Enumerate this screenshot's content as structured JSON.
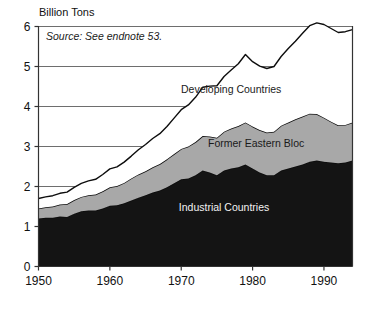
{
  "chart_data": {
    "type": "area",
    "stacked": true,
    "title": "",
    "ylabel": "Billion Tons",
    "xlabel": "",
    "xlim": [
      1950,
      1994
    ],
    "ylim": [
      0,
      6
    ],
    "yticks": [
      0,
      1,
      2,
      3,
      4,
      5,
      6
    ],
    "ytick_labels": [
      "0",
      "1",
      "2",
      "3",
      "4",
      "5",
      "6"
    ],
    "xticks": [
      1950,
      1960,
      1970,
      1980,
      1990
    ],
    "xtick_labels": [
      "1950",
      "1960",
      "1970",
      "1980",
      "1990"
    ],
    "grid": "horizontal-gridlines-at-2-3-4-5-6",
    "legend_position": "inline-annotations",
    "source_note": "Source: See endnote 53.",
    "x": [
      1950,
      1951,
      1952,
      1953,
      1954,
      1955,
      1956,
      1957,
      1958,
      1959,
      1960,
      1961,
      1962,
      1963,
      1964,
      1965,
      1966,
      1967,
      1968,
      1969,
      1970,
      1971,
      1972,
      1973,
      1974,
      1975,
      1976,
      1977,
      1978,
      1979,
      1980,
      1981,
      1982,
      1983,
      1984,
      1985,
      1986,
      1987,
      1988,
      1989,
      1990,
      1991,
      1992,
      1993,
      1994
    ],
    "series": [
      {
        "name": "Industrial Countries",
        "color": "#141414",
        "label_color": "#f2f2f2",
        "values": [
          1.2,
          1.22,
          1.22,
          1.25,
          1.24,
          1.32,
          1.38,
          1.4,
          1.4,
          1.45,
          1.52,
          1.53,
          1.58,
          1.65,
          1.72,
          1.78,
          1.85,
          1.9,
          1.98,
          2.08,
          2.18,
          2.2,
          2.28,
          2.4,
          2.35,
          2.28,
          2.4,
          2.45,
          2.48,
          2.55,
          2.45,
          2.35,
          2.28,
          2.28,
          2.4,
          2.45,
          2.5,
          2.55,
          2.62,
          2.65,
          2.62,
          2.6,
          2.58,
          2.6,
          2.65
        ]
      },
      {
        "name": "Former Eastern Bloc",
        "color": "#a8a8a8",
        "label_color": "#1a1a1a",
        "values": [
          0.25,
          0.26,
          0.28,
          0.3,
          0.32,
          0.34,
          0.36,
          0.38,
          0.4,
          0.43,
          0.46,
          0.48,
          0.51,
          0.55,
          0.58,
          0.6,
          0.63,
          0.66,
          0.7,
          0.73,
          0.76,
          0.8,
          0.83,
          0.86,
          0.9,
          0.94,
          0.97,
          1.0,
          1.03,
          1.05,
          1.05,
          1.06,
          1.07,
          1.09,
          1.12,
          1.15,
          1.18,
          1.2,
          1.2,
          1.16,
          1.1,
          1.02,
          0.95,
          0.94,
          0.95
        ]
      },
      {
        "name": "Developing Countries",
        "color": "#ffffff",
        "label_color": "#1a1a1a",
        "values": [
          0.25,
          0.26,
          0.27,
          0.28,
          0.3,
          0.32,
          0.34,
          0.36,
          0.38,
          0.42,
          0.46,
          0.48,
          0.52,
          0.56,
          0.62,
          0.67,
          0.72,
          0.76,
          0.82,
          0.9,
          0.98,
          1.04,
          1.12,
          1.22,
          1.26,
          1.3,
          1.38,
          1.46,
          1.56,
          1.7,
          1.62,
          1.6,
          1.6,
          1.63,
          1.73,
          1.85,
          1.95,
          2.08,
          2.2,
          2.28,
          2.33,
          2.33,
          2.32,
          2.33,
          2.32
        ]
      }
    ],
    "totals_note": "Total ranges from about 1.7 billion tons in 1950 to about 5.9 billion tons in 1994",
    "annotations": [
      {
        "text": "Developing Countries",
        "x": 1977,
        "y": 4.35
      },
      {
        "text": "Former Eastern Bloc",
        "x": 1980.5,
        "y": 3.0
      },
      {
        "text": "Industrial Countries",
        "x": 1976,
        "y": 1.38
      }
    ]
  },
  "chart_meta": {
    "y_axis_title": "Billion Tons",
    "source": "Source: See endnote 53."
  }
}
